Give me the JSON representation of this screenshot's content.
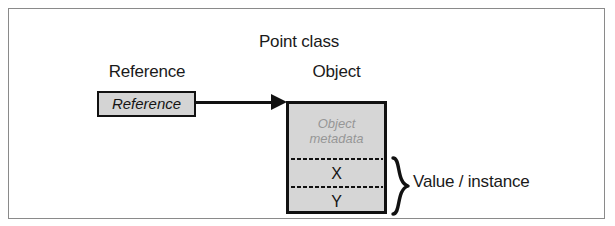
{
  "figure": {
    "title": "Point class",
    "headings": {
      "reference": "Reference",
      "object": "Object"
    },
    "reference_box": {
      "label": "Reference",
      "fill_color": "#d4d4d4",
      "border_color": "#111111"
    },
    "object_box": {
      "metadata_line1": "Object",
      "metadata_line2": "metadata",
      "metadata_color": "#969696",
      "fields": [
        "X",
        "Y"
      ],
      "fill_color": "#d6d6d6",
      "border_color": "#111111"
    },
    "brace_label": "Value / instance",
    "frame_color": "#8a8a8a",
    "background_color": "#ffffff"
  }
}
